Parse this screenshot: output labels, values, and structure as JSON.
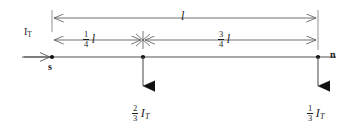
{
  "diagram": {
    "type": "engineering-line-diagram",
    "background_color": "#ffffff",
    "line_color": "#555555",
    "text_color": "#1a1a1a",
    "marker_color": "#111111",
    "nodes": [
      {
        "id": "s",
        "label": "s",
        "x": 52,
        "y": 57
      },
      {
        "id": "mid",
        "label": "",
        "x": 143,
        "y": 57
      },
      {
        "id": "n",
        "label": "n",
        "x": 318,
        "y": 57
      }
    ],
    "source_current": {
      "label_main": "I",
      "label_sub": "T",
      "x": 30,
      "y": 30
    },
    "dimensions": [
      {
        "name": "total-length",
        "label_type": "plain",
        "text": "l",
        "x_start": 52,
        "x_end": 318,
        "y": 18
      },
      {
        "name": "first-segment",
        "label_type": "fraction",
        "numerator": "1",
        "denominator": "4",
        "unit": "l",
        "unit_sub": "",
        "x_start": 52,
        "x_end": 143,
        "y": 40
      },
      {
        "name": "second-segment",
        "label_type": "fraction",
        "numerator": "3",
        "denominator": "4",
        "unit": "l",
        "unit_sub": "",
        "x_start": 143,
        "x_end": 318,
        "y": 40
      }
    ],
    "loads": [
      {
        "name": "load-at-mid",
        "numerator": "2",
        "denominator": "3",
        "unit": "I",
        "unit_sub": "T",
        "x": 143,
        "arrow_top": 57,
        "arrow_tip": 98
      },
      {
        "name": "load-at-n",
        "numerator": "1",
        "denominator": "3",
        "unit": "I",
        "unit_sub": "T",
        "x": 318,
        "arrow_top": 57,
        "arrow_tip": 98
      }
    ]
  }
}
